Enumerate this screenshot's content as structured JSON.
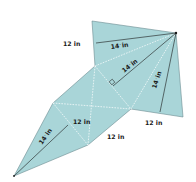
{
  "diagram": {
    "type": "square pyramid net",
    "fill_color": "#a9d5d8",
    "edge_color": "#5a6f72",
    "fold_line_color": "#ffffff",
    "labels": {
      "top_left_base": "12 in",
      "top_slant": "14",
      "top_slant_unit": "in",
      "center_slant": "14",
      "center_slant_unit": "in",
      "right_slant": "14",
      "right_slant_unit": "in",
      "right_base": "12 in",
      "middle_base": "12 in",
      "bottom_base": "12 in",
      "bottom_slant": "14",
      "bottom_slant_unit": "in"
    },
    "slant_fraction_note": "fractional part of slant height not legible at this resolution"
  }
}
